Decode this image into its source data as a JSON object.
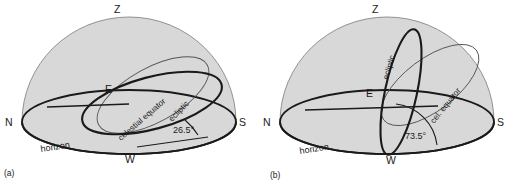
{
  "figure": {
    "background_color": "#ffffff",
    "dome_fill": "#d8d8d8",
    "line_color": "#1a1a1a",
    "thin_line_color": "#555555"
  },
  "panels": [
    {
      "id": "a",
      "caption": "(a)",
      "zenith_label": "Z",
      "cardinal_points": [
        {
          "name": "north",
          "label": "N"
        },
        {
          "name": "east",
          "label": "E"
        },
        {
          "name": "south",
          "label": "S"
        },
        {
          "name": "west",
          "label": "W"
        }
      ],
      "horizon_label": "horizon",
      "curves": [
        {
          "name": "celestial-equator",
          "label": "celestial equator",
          "weight": "thin"
        },
        {
          "name": "ecliptic",
          "label": "ecliptic",
          "weight": "thick"
        }
      ],
      "angle": {
        "label": "26.5°",
        "value": 26.5,
        "unit": "degrees",
        "vertex": "W",
        "between": [
          "horizon",
          "ecliptic"
        ]
      }
    },
    {
      "id": "b",
      "caption": "(b)",
      "zenith_label": "Z",
      "cardinal_points": [
        {
          "name": "north",
          "label": "N"
        },
        {
          "name": "east",
          "label": "E"
        },
        {
          "name": "south",
          "label": "S"
        },
        {
          "name": "west",
          "label": "W"
        }
      ],
      "horizon_label": "horizon",
      "curves": [
        {
          "name": "ecliptic",
          "label": "ecliptic",
          "weight": "thick"
        },
        {
          "name": "celestial-equator",
          "label": "cel. equator",
          "weight": "thin"
        }
      ],
      "angle": {
        "label": "73.5°",
        "value": 73.5,
        "unit": "degrees",
        "vertex": "W",
        "between": [
          "horizon",
          "ecliptic"
        ]
      }
    }
  ]
}
